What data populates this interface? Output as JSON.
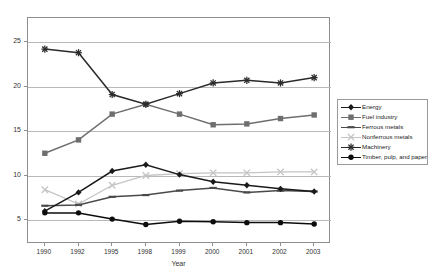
{
  "top_fragment": "",
  "chart_data": {
    "type": "line",
    "title": "",
    "xlabel": "Year",
    "ylabel": "",
    "categories": [
      "1990",
      "1992",
      "1995",
      "1998",
      "1999",
      "2000",
      "2001",
      "2002",
      "2003"
    ],
    "yticks": [
      5,
      10,
      15,
      20,
      25
    ],
    "ylim": [
      2.3,
      27.7
    ],
    "grid": true,
    "legend_position": "right",
    "series": [
      {
        "name": "Energy",
        "color": "#1a1a1a",
        "marker": "diamond",
        "values": [
          6.0,
          8.1,
          10.5,
          11.2,
          10.1,
          9.3,
          8.9,
          8.5,
          8.2
        ]
      },
      {
        "name": "Fuel industry",
        "color": "#6e6e6e",
        "marker": "square",
        "values": [
          12.5,
          14.0,
          16.9,
          18.0,
          16.9,
          15.7,
          15.8,
          16.4,
          16.8
        ]
      },
      {
        "name": "Ferrous metals",
        "color": "#4a4a4a",
        "marker": "dash",
        "values": [
          6.6,
          6.7,
          7.6,
          7.8,
          8.3,
          8.6,
          8.1,
          8.3,
          8.2
        ]
      },
      {
        "name": "Nonferrous metals",
        "color": "#c4c4c4",
        "marker": "cross",
        "values": [
          8.4,
          6.8,
          8.9,
          10.0,
          10.2,
          10.3,
          10.3,
          10.4,
          10.4
        ]
      },
      {
        "name": "Machinery",
        "color": "#2b2b2b",
        "marker": "star",
        "values": [
          24.2,
          23.8,
          19.1,
          18.0,
          19.2,
          20.4,
          20.7,
          20.4,
          21.0
        ]
      },
      {
        "name": "Timber, pulp, and paper",
        "color": "#0d0d0d",
        "marker": "circle",
        "values": [
          5.8,
          5.8,
          5.1,
          4.5,
          4.85,
          4.8,
          4.7,
          4.7,
          4.55
        ]
      }
    ]
  }
}
